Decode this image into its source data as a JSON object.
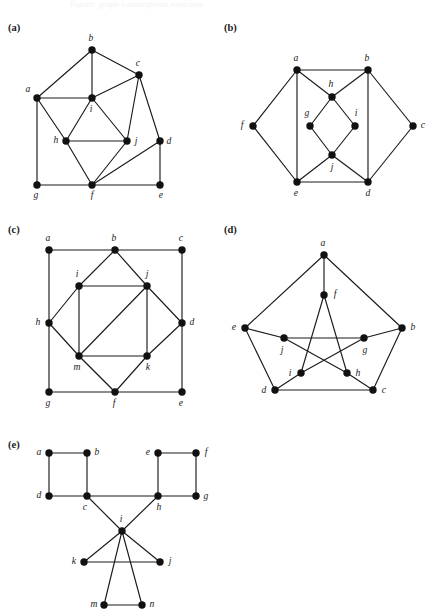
{
  "page": {
    "width": 432,
    "height": 604,
    "background": "#ffffff",
    "ink": "#1a1a1a",
    "header_faint_text": "Figure: graph isomorphism exercises"
  },
  "figures": [
    {
      "id": "a",
      "panel_label": "(a)",
      "label_pos": [
        8,
        22
      ],
      "origin": [
        0,
        0
      ],
      "viewbox": [
        0,
        0,
        216,
        210
      ],
      "vertices": [
        {
          "name": "a",
          "x": 37,
          "y": 98,
          "label_dx": -9,
          "label_dy": -8
        },
        {
          "name": "b",
          "x": 92,
          "y": 50,
          "label_dx": -1,
          "label_dy": -11
        },
        {
          "name": "c",
          "x": 139,
          "y": 75,
          "label_dx": -1,
          "label_dy": -11
        },
        {
          "name": "d",
          "x": 160,
          "y": 141,
          "label_dx": 9,
          "label_dy": 1
        },
        {
          "name": "e",
          "x": 160,
          "y": 185,
          "label_dx": 1,
          "label_dy": 11
        },
        {
          "name": "f",
          "x": 92,
          "y": 185,
          "label_dx": 0,
          "label_dy": 11
        },
        {
          "name": "g",
          "x": 37,
          "y": 185,
          "label_dx": -1,
          "label_dy": 11
        },
        {
          "name": "h",
          "x": 66,
          "y": 141,
          "label_dx": -10,
          "label_dy": 0
        },
        {
          "name": "i",
          "x": 92,
          "y": 98,
          "label_dx": -1,
          "label_dy": 12
        },
        {
          "name": "j",
          "x": 127,
          "y": 141,
          "label_dx": 9,
          "label_dy": 1
        }
      ],
      "edges": [
        [
          "a",
          "b"
        ],
        [
          "b",
          "c"
        ],
        [
          "b",
          "i"
        ],
        [
          "a",
          "i"
        ],
        [
          "a",
          "g"
        ],
        [
          "a",
          "h"
        ],
        [
          "c",
          "i"
        ],
        [
          "c",
          "j"
        ],
        [
          "c",
          "d"
        ],
        [
          "d",
          "e"
        ],
        [
          "d",
          "f"
        ],
        [
          "g",
          "f"
        ],
        [
          "f",
          "e"
        ],
        [
          "f",
          "h"
        ],
        [
          "f",
          "j"
        ],
        [
          "h",
          "i"
        ],
        [
          "h",
          "j"
        ],
        [
          "i",
          "j"
        ]
      ]
    },
    {
      "id": "b",
      "panel_label": "(b)",
      "label_pos": [
        224,
        22
      ],
      "origin": [
        216,
        0
      ],
      "viewbox": [
        0,
        0,
        216,
        215
      ],
      "vertices": [
        {
          "name": "a",
          "x": 81,
          "y": 70,
          "label_dx": -1,
          "label_dy": -11
        },
        {
          "name": "b",
          "x": 152,
          "y": 70,
          "label_dx": -1,
          "label_dy": -11
        },
        {
          "name": "c",
          "x": 197,
          "y": 126,
          "label_dx": 10,
          "label_dy": 0
        },
        {
          "name": "d",
          "x": 152,
          "y": 182,
          "label_dx": 0,
          "label_dy": 12
        },
        {
          "name": "e",
          "x": 81,
          "y": 182,
          "label_dx": -1,
          "label_dy": 12
        },
        {
          "name": "f",
          "x": 37,
          "y": 126,
          "label_dx": -11,
          "label_dy": 0
        },
        {
          "name": "g",
          "x": 94,
          "y": 126,
          "label_dx": -3,
          "label_dy": -12
        },
        {
          "name": "h",
          "x": 116,
          "y": 97,
          "label_dx": -1,
          "label_dy": -12
        },
        {
          "name": "i",
          "x": 139,
          "y": 126,
          "label_dx": 1,
          "label_dy": -12
        },
        {
          "name": "j",
          "x": 116,
          "y": 155,
          "label_dx": 0,
          "label_dy": 13
        }
      ],
      "edges": [
        [
          "a",
          "b"
        ],
        [
          "a",
          "f"
        ],
        [
          "a",
          "e"
        ],
        [
          "a",
          "h"
        ],
        [
          "b",
          "c"
        ],
        [
          "b",
          "d"
        ],
        [
          "b",
          "h"
        ],
        [
          "f",
          "e"
        ],
        [
          "c",
          "d"
        ],
        [
          "e",
          "d"
        ],
        [
          "e",
          "j"
        ],
        [
          "d",
          "j"
        ],
        [
          "h",
          "g"
        ],
        [
          "h",
          "i"
        ],
        [
          "g",
          "j"
        ],
        [
          "i",
          "j"
        ]
      ]
    },
    {
      "id": "c",
      "panel_label": "(c)",
      "label_pos": [
        8,
        224
      ],
      "origin": [
        0,
        210
      ],
      "viewbox": [
        0,
        0,
        216,
        215
      ],
      "vertices": [
        {
          "name": "a",
          "x": 49,
          "y": 40,
          "label_dx": -1,
          "label_dy": -11
        },
        {
          "name": "b",
          "x": 115,
          "y": 40,
          "label_dx": -1,
          "label_dy": -11
        },
        {
          "name": "c",
          "x": 182,
          "y": 40,
          "label_dx": -1,
          "label_dy": -11
        },
        {
          "name": "d",
          "x": 182,
          "y": 113,
          "label_dx": 10,
          "label_dy": 0
        },
        {
          "name": "e",
          "x": 182,
          "y": 182,
          "label_dx": -1,
          "label_dy": 12
        },
        {
          "name": "f",
          "x": 115,
          "y": 182,
          "label_dx": -1,
          "label_dy": 12
        },
        {
          "name": "g",
          "x": 49,
          "y": 182,
          "label_dx": -1,
          "label_dy": 12
        },
        {
          "name": "h",
          "x": 49,
          "y": 113,
          "label_dx": -11,
          "label_dy": 0
        },
        {
          "name": "i",
          "x": 79,
          "y": 76,
          "label_dx": -2,
          "label_dy": -11
        },
        {
          "name": "j",
          "x": 147,
          "y": 76,
          "label_dx": 0,
          "label_dy": -11
        },
        {
          "name": "k",
          "x": 147,
          "y": 146,
          "label_dx": 1,
          "label_dy": 12
        },
        {
          "name": "m",
          "x": 79,
          "y": 146,
          "label_dx": -2,
          "label_dy": 12
        }
      ],
      "edges": [
        [
          "a",
          "b"
        ],
        [
          "b",
          "c"
        ],
        [
          "a",
          "h"
        ],
        [
          "h",
          "g"
        ],
        [
          "c",
          "d"
        ],
        [
          "d",
          "e"
        ],
        [
          "g",
          "f"
        ],
        [
          "f",
          "e"
        ],
        [
          "b",
          "i"
        ],
        [
          "b",
          "j"
        ],
        [
          "i",
          "h"
        ],
        [
          "h",
          "m"
        ],
        [
          "j",
          "d"
        ],
        [
          "d",
          "k"
        ],
        [
          "m",
          "f"
        ],
        [
          "f",
          "k"
        ],
        [
          "i",
          "j"
        ],
        [
          "j",
          "k"
        ],
        [
          "k",
          "m"
        ],
        [
          "m",
          "i"
        ],
        [
          "m",
          "j"
        ]
      ]
    },
    {
      "id": "d",
      "panel_label": "(d)",
      "label_pos": [
        224,
        224
      ],
      "origin": [
        216,
        210
      ],
      "viewbox": [
        0,
        0,
        216,
        215
      ],
      "vertices": [
        {
          "name": "a",
          "x": 108,
          "y": 45,
          "label_dx": -1,
          "label_dy": -11
        },
        {
          "name": "b",
          "x": 186,
          "y": 118,
          "label_dx": 11,
          "label_dy": 0
        },
        {
          "name": "c",
          "x": 157,
          "y": 180,
          "label_dx": 11,
          "label_dy": 1
        },
        {
          "name": "d",
          "x": 59,
          "y": 180,
          "label_dx": -11,
          "label_dy": 1
        },
        {
          "name": "e",
          "x": 29,
          "y": 118,
          "label_dx": -11,
          "label_dy": 0
        },
        {
          "name": "f",
          "x": 108,
          "y": 85,
          "label_dx": 11,
          "label_dy": 0
        },
        {
          "name": "g",
          "x": 148,
          "y": 128,
          "label_dx": 1,
          "label_dy": 13
        },
        {
          "name": "h",
          "x": 131,
          "y": 163,
          "label_dx": 11,
          "label_dy": 1
        },
        {
          "name": "i",
          "x": 85,
          "y": 163,
          "label_dx": -11,
          "label_dy": 1
        },
        {
          "name": "j",
          "x": 68,
          "y": 128,
          "label_dx": -2,
          "label_dy": 13
        }
      ],
      "edges": [
        [
          "a",
          "b"
        ],
        [
          "b",
          "c"
        ],
        [
          "c",
          "d"
        ],
        [
          "d",
          "e"
        ],
        [
          "e",
          "a"
        ],
        [
          "a",
          "f"
        ],
        [
          "b",
          "g"
        ],
        [
          "c",
          "h"
        ],
        [
          "d",
          "i"
        ],
        [
          "e",
          "j"
        ],
        [
          "f",
          "h"
        ],
        [
          "h",
          "j"
        ],
        [
          "j",
          "g"
        ],
        [
          "g",
          "i"
        ],
        [
          "i",
          "f"
        ]
      ]
    },
    {
      "id": "e",
      "panel_label": "(e)",
      "label_pos": [
        8,
        439
      ],
      "origin": [
        0,
        425
      ],
      "viewbox": [
        0,
        0,
        230,
        185
      ],
      "vertices": [
        {
          "name": "a",
          "x": 49,
          "y": 28,
          "label_dx": -10,
          "label_dy": 0
        },
        {
          "name": "b",
          "x": 87,
          "y": 28,
          "label_dx": 10,
          "label_dy": 0
        },
        {
          "name": "c",
          "x": 87,
          "y": 71,
          "label_dx": -2,
          "label_dy": 12
        },
        {
          "name": "d",
          "x": 49,
          "y": 71,
          "label_dx": -10,
          "label_dy": 0
        },
        {
          "name": "e",
          "x": 158,
          "y": 28,
          "label_dx": -10,
          "label_dy": 0
        },
        {
          "name": "f",
          "x": 196,
          "y": 28,
          "label_dx": 10,
          "label_dy": 0
        },
        {
          "name": "g",
          "x": 196,
          "y": 71,
          "label_dx": 10,
          "label_dy": 1
        },
        {
          "name": "h",
          "x": 158,
          "y": 71,
          "label_dx": 1,
          "label_dy": 12
        },
        {
          "name": "i",
          "x": 122,
          "y": 106,
          "label_dx": -1,
          "label_dy": -11
        },
        {
          "name": "j",
          "x": 160,
          "y": 137,
          "label_dx": 10,
          "label_dy": 0
        },
        {
          "name": "k",
          "x": 84,
          "y": 137,
          "label_dx": -10,
          "label_dy": 0
        },
        {
          "name": "m",
          "x": 104,
          "y": 180,
          "label_dx": -10,
          "label_dy": 0
        },
        {
          "name": "n",
          "x": 142,
          "y": 180,
          "label_dx": 10,
          "label_dy": 0
        }
      ],
      "edges": [
        [
          "a",
          "b"
        ],
        [
          "a",
          "d"
        ],
        [
          "b",
          "c"
        ],
        [
          "d",
          "c"
        ],
        [
          "e",
          "f"
        ],
        [
          "e",
          "h"
        ],
        [
          "f",
          "g"
        ],
        [
          "h",
          "g"
        ],
        [
          "c",
          "h"
        ],
        [
          "c",
          "i"
        ],
        [
          "h",
          "i"
        ],
        [
          "i",
          "k"
        ],
        [
          "i",
          "j"
        ],
        [
          "k",
          "j"
        ],
        [
          "i",
          "m"
        ],
        [
          "i",
          "n"
        ],
        [
          "m",
          "n"
        ]
      ]
    }
  ]
}
